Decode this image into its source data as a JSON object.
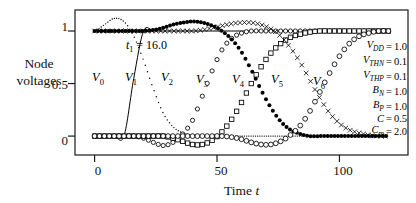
{
  "figure": {
    "axes": {
      "x": {
        "label": "Time t",
        "label_main": "Time",
        "label_var": "t",
        "ticks": [
          0,
          50,
          100
        ],
        "tick_labels": [
          "0",
          "50",
          "100"
        ],
        "min": -8,
        "max": 128
      },
      "y": {
        "label_line1": "Node",
        "label_line2": "voltages",
        "ticks": [
          0,
          0.5,
          1
        ],
        "tick_labels": [
          "0",
          "0.5",
          "1"
        ],
        "min": -0.18,
        "max": 1.2
      },
      "frame": true,
      "grid": false
    },
    "annotations": [
      {
        "name": "t1-annotation",
        "text": "t₁ = 16.0",
        "sym": "t",
        "sub": "1",
        "rest": " = 16.0",
        "x": 126,
        "y": 44
      }
    ],
    "curve_labels": [
      {
        "name": "V0",
        "text": "V",
        "sub": "0",
        "x": 92,
        "y": 78
      },
      {
        "name": "V1",
        "text": "V",
        "sub": "1",
        "x": 126,
        "y": 78
      },
      {
        "name": "V2",
        "text": "V",
        "sub": "2",
        "x": 163,
        "y": 78
      },
      {
        "name": "V3",
        "text": "V",
        "sub": "3",
        "x": 196,
        "y": 80
      },
      {
        "name": "V4",
        "text": "V",
        "sub": "4",
        "x": 233,
        "y": 80
      },
      {
        "name": "V5",
        "text": "V",
        "sub": "5",
        "x": 272,
        "y": 80
      },
      {
        "name": "V6",
        "text": "V",
        "sub": "6",
        "x": 314,
        "y": 82
      }
    ],
    "parameters": [
      {
        "sym": "V",
        "sub": "DD",
        "eq": "=",
        "val": "1.0"
      },
      {
        "sym": "V",
        "sub": "THN",
        "eq": "=",
        "val": "0.1"
      },
      {
        "sym": "V",
        "sub": "THP",
        "eq": "=",
        "val": "0.1"
      },
      {
        "sym": "B",
        "sub": "N",
        "eq": "=",
        "val": "1.0"
      },
      {
        "sym": "B",
        "sub": "P",
        "eq": "=",
        "val": "1.0"
      },
      {
        "sym": "C",
        "sub": "",
        "eq": "=",
        "val": "0.5"
      },
      {
        "sym": "C",
        "sub": "m",
        "eq": "=",
        "val": "2.0"
      }
    ]
  },
  "chart_data": {
    "type": "line",
    "title": "",
    "xlabel": "Time t",
    "ylabel": "Node voltages",
    "xlim": [
      -8,
      128
    ],
    "ylim": [
      -0.18,
      1.2
    ],
    "xticks": [
      0,
      50,
      100
    ],
    "yticks": [
      0,
      0.5,
      1
    ],
    "grid": false,
    "legend": "inline-curve-labels",
    "annotation": "t1 = 16.0",
    "parameters": {
      "V_DD": 1.0,
      "V_THN": 0.1,
      "V_THP": 0.1,
      "B_N": 1.0,
      "B_P": 1.0,
      "C": 0.5,
      "C_m": 2.0
    },
    "x": [
      0,
      4,
      8,
      12,
      16,
      20,
      24,
      28,
      32,
      36,
      40,
      44,
      48,
      52,
      56,
      60,
      64,
      68,
      72,
      76,
      80,
      84,
      88,
      92,
      96,
      100,
      104,
      108,
      112,
      116,
      120
    ],
    "series": [
      {
        "name": "V0",
        "label": "V₀",
        "marker": "none",
        "style": "solid-thin",
        "values": [
          0.0,
          0.0,
          0.0,
          0.0,
          0.55,
          1.0,
          1.0,
          1.0,
          1.0,
          1.0,
          1.0,
          1.0,
          1.0,
          1.0,
          1.0,
          1.0,
          1.0,
          1.0,
          1.0,
          1.0,
          1.0,
          1.0,
          1.0,
          1.0,
          1.0,
          1.0,
          1.0,
          1.0,
          1.0,
          1.0,
          1.0
        ]
      },
      {
        "name": "V1",
        "label": "V₁",
        "marker": "dotted",
        "style": "dotted",
        "values": [
          1.0,
          1.06,
          1.12,
          1.09,
          0.95,
          0.72,
          0.45,
          0.22,
          0.09,
          0.03,
          0.01,
          0.0,
          0.0,
          0.0,
          0.0,
          0.0,
          0.0,
          0.0,
          0.0,
          0.0,
          0.0,
          0.0,
          0.0,
          0.0,
          0.0,
          0.0,
          0.0,
          0.0,
          0.0,
          0.0,
          0.0
        ]
      },
      {
        "name": "V2",
        "label": "V₂",
        "marker": "open-circle",
        "style": "markers",
        "values": [
          0.0,
          0.0,
          0.0,
          0.0,
          0.0,
          -0.02,
          -0.06,
          -0.09,
          -0.06,
          0.02,
          0.15,
          0.38,
          0.62,
          0.82,
          0.93,
          0.98,
          1.0,
          1.0,
          1.0,
          1.0,
          1.0,
          1.0,
          1.0,
          1.0,
          1.0,
          1.0,
          1.0,
          1.0,
          1.0,
          1.0,
          1.0
        ]
      },
      {
        "name": "V3",
        "label": "V₃",
        "marker": "filled-circle",
        "style": "markers",
        "values": [
          1.0,
          1.0,
          1.0,
          1.0,
          1.0,
          1.0,
          1.01,
          1.03,
          1.06,
          1.08,
          1.09,
          1.08,
          1.05,
          1.0,
          0.92,
          0.8,
          0.63,
          0.44,
          0.27,
          0.14,
          0.06,
          0.02,
          0.0,
          0.0,
          0.0,
          0.0,
          0.0,
          0.0,
          0.0,
          0.0,
          0.0
        ]
      },
      {
        "name": "V4",
        "label": "V₄",
        "marker": "open-square",
        "style": "markers",
        "values": [
          0.0,
          0.0,
          0.0,
          0.0,
          0.0,
          0.0,
          0.0,
          0.0,
          -0.02,
          -0.05,
          -0.08,
          -0.08,
          -0.04,
          0.04,
          0.16,
          0.32,
          0.5,
          0.66,
          0.79,
          0.88,
          0.94,
          0.97,
          0.99,
          1.0,
          1.0,
          1.0,
          1.0,
          1.0,
          1.0,
          1.0,
          1.0
        ]
      },
      {
        "name": "V5",
        "label": "V₅",
        "marker": "cross",
        "style": "markers",
        "values": [
          1.0,
          1.0,
          1.0,
          1.0,
          1.0,
          1.0,
          1.0,
          1.0,
          1.0,
          1.0,
          1.0,
          1.01,
          1.03,
          1.05,
          1.07,
          1.08,
          1.08,
          1.06,
          1.02,
          0.95,
          0.84,
          0.7,
          0.53,
          0.36,
          0.22,
          0.12,
          0.06,
          0.03,
          0.01,
          0.0,
          0.0
        ]
      },
      {
        "name": "V6",
        "label": "V₆",
        "marker": "open-circle-large",
        "style": "markers",
        "values": [
          0.0,
          0.0,
          0.0,
          0.0,
          0.0,
          0.0,
          0.0,
          0.0,
          0.0,
          0.0,
          0.0,
          0.0,
          0.0,
          0.0,
          -0.01,
          -0.03,
          -0.06,
          -0.08,
          -0.08,
          -0.05,
          0.01,
          0.1,
          0.24,
          0.42,
          0.6,
          0.76,
          0.88,
          0.95,
          0.98,
          1.0,
          1.0
        ]
      }
    ]
  }
}
